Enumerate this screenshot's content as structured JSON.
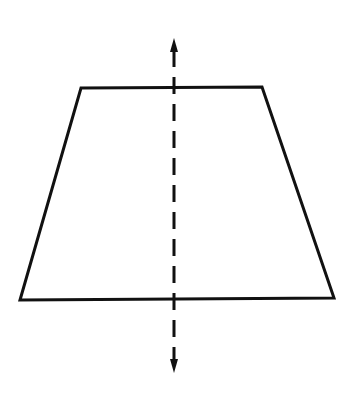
{
  "diagram": {
    "colors": {
      "background": "#ffffff",
      "stroke": "#111111"
    },
    "trapezoid": {
      "points": [
        [
          81,
          88
        ],
        [
          262,
          87
        ],
        [
          334,
          298
        ],
        [
          20,
          300
        ]
      ],
      "stroke_width": 3
    },
    "symmetry_axis": {
      "x": 174,
      "y_top": 38,
      "y_bottom": 373,
      "dash": "17,10",
      "stroke_width": 3,
      "arrowheads": [
        "up",
        "down"
      ]
    }
  }
}
